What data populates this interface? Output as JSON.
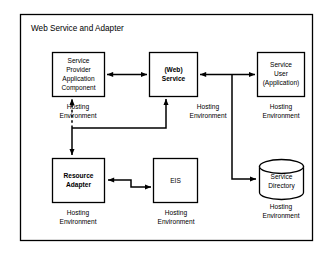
{
  "diagram": {
    "title": "Web Service and Adapter",
    "frame": {
      "name": "outer-frame"
    },
    "nodes": [
      {
        "id": "service-provider-application-component",
        "shape": "rectangle",
        "bold": false,
        "lines": [
          "Service",
          "Provider",
          "Application",
          "Component"
        ],
        "environment": [
          "Hosting",
          "Environment"
        ]
      },
      {
        "id": "web-service",
        "shape": "rectangle",
        "bold": true,
        "lines": [
          "(Web)",
          "Service"
        ],
        "environment": [
          "Hosting",
          "Environment"
        ]
      },
      {
        "id": "service-user-application",
        "shape": "rectangle",
        "bold": false,
        "lines": [
          "Service",
          "User",
          "(Application)"
        ],
        "environment": [
          "Hosting",
          "Environment"
        ]
      },
      {
        "id": "resource-adapter",
        "shape": "rectangle",
        "bold": true,
        "lines": [
          "Resource",
          "Adapter"
        ],
        "environment": [
          "Hosting",
          "Environment"
        ]
      },
      {
        "id": "eis",
        "shape": "rectangle",
        "bold": false,
        "lines": [
          "EIS"
        ],
        "environment": [
          "Hosting",
          "Environment"
        ]
      },
      {
        "id": "service-directory",
        "shape": "cylinder",
        "bold": false,
        "lines": [
          "Service",
          "Directory"
        ],
        "environment": [
          "Hosting",
          "Environment"
        ]
      }
    ],
    "connectors": [
      {
        "id": "provider-to-web-service",
        "style": "solid",
        "arrows": "both"
      },
      {
        "id": "web-service-to-service-user",
        "style": "solid",
        "arrows": "both"
      },
      {
        "id": "web-service-branch-to-service-directory",
        "style": "solid",
        "arrows": "end"
      },
      {
        "id": "adapter-to-web-service",
        "style": "solid",
        "arrows": "end"
      },
      {
        "id": "adapter-to-provider",
        "style": "dashed",
        "arrows": "end"
      },
      {
        "id": "branch-to-resource-adapter",
        "style": "solid",
        "arrows": "end"
      },
      {
        "id": "resource-adapter-to-eis",
        "style": "solid",
        "arrows": "both"
      }
    ],
    "colors": {
      "stroke": "#000000",
      "background": "#ffffff",
      "node_fill": "#ffffff"
    }
  }
}
